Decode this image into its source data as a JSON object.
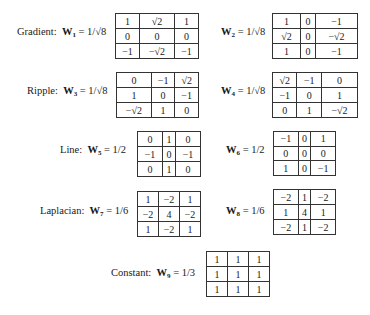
{
  "masks": [
    {
      "id": "W1",
      "name": "Gradient",
      "sub": "1",
      "coef": "1/√8",
      "rows": [
        [
          "1",
          "√2",
          "1"
        ],
        [
          "0",
          "0",
          "0"
        ],
        [
          "−1",
          "−√2",
          "−1"
        ]
      ]
    },
    {
      "id": "W2",
      "name": "",
      "sub": "2",
      "coef": "1/√8",
      "rows": [
        [
          "1",
          "0",
          "−1"
        ],
        [
          "√2",
          "0",
          "−√2"
        ],
        [
          "1",
          "0",
          "−1"
        ]
      ]
    },
    {
      "id": "W3",
      "name": "Ripple",
      "sub": "3",
      "coef": "1/√8",
      "rows": [
        [
          "0",
          "−1",
          "√2"
        ],
        [
          "1",
          "0",
          "−1"
        ],
        [
          "−√2",
          "1",
          "0"
        ]
      ]
    },
    {
      "id": "W4",
      "name": "",
      "sub": "4",
      "coef": "1/√8",
      "rows": [
        [
          "√2",
          "−1",
          "0"
        ],
        [
          "−1",
          "0",
          "1"
        ],
        [
          "0",
          "1",
          "−√2"
        ]
      ]
    },
    {
      "id": "W5",
      "name": "Line",
      "sub": "5",
      "coef": "1/2",
      "rows": [
        [
          "0",
          "1",
          "0"
        ],
        [
          "−1",
          "0",
          "−1"
        ],
        [
          "0",
          "1",
          "0"
        ]
      ]
    },
    {
      "id": "W6",
      "name": "",
      "sub": "6",
      "coef": "1/2",
      "rows": [
        [
          "−1",
          "0",
          "1"
        ],
        [
          "0",
          "0",
          "0"
        ],
        [
          "1",
          "0",
          "−1"
        ]
      ]
    },
    {
      "id": "W7",
      "name": "Laplacian",
      "sub": "7",
      "coef": "1/6",
      "rows": [
        [
          "1",
          "−2",
          "1"
        ],
        [
          "−2",
          "4",
          "−2"
        ],
        [
          "1",
          "−2",
          "1"
        ]
      ]
    },
    {
      "id": "W8",
      "name": "",
      "sub": "8",
      "coef": "1/6",
      "rows": [
        [
          "−2",
          "1",
          "−2"
        ],
        [
          "1",
          "4",
          "1"
        ],
        [
          "−2",
          "1",
          "−2"
        ]
      ]
    },
    {
      "id": "W9",
      "name": "Constant",
      "sub": "9",
      "coef": "1/3",
      "rows": [
        [
          "1",
          "1",
          "1"
        ],
        [
          "1",
          "1",
          "1"
        ],
        [
          "1",
          "1",
          "1"
        ]
      ]
    }
  ],
  "symbols": {
    "W": "W",
    "eq": " = ",
    "colon": ":"
  }
}
